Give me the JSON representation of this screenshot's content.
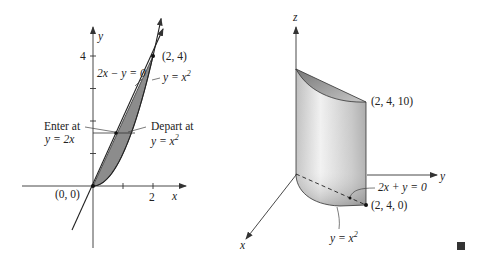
{
  "left_panel": {
    "axis_x_label": "x",
    "axis_y_label": "y",
    "tick_x_label": "2",
    "tick_y_label": "4",
    "origin_label": "(0, 0)",
    "point_label": "(2, 4)",
    "line_label": "2x − y = 0",
    "curve_label": "y = x",
    "curve_exp": "2",
    "enter_label_1": "Enter at",
    "enter_label_2": "y = 2x",
    "depart_label_1": "Depart at",
    "depart_label_2": "y = x",
    "depart_exp": "2",
    "region": {
      "bounded_by": [
        "y = 2x",
        "y = x^2"
      ],
      "x_range": [
        0,
        2
      ]
    }
  },
  "right_panel": {
    "axis_x_label": "x",
    "axis_y_label": "y",
    "axis_z_label": "z",
    "top_point_label": "(2, 4, 10)",
    "base_point_label": "(2, 4, 0)",
    "plane_label": "2x + y = 0",
    "curve_label": "y = x",
    "curve_exp": "2"
  },
  "end_mark": "■",
  "colors": {
    "region_fill": "#8c8c8c",
    "solid_light": "#e8e8e8",
    "solid_dark": "#9a9a9a",
    "ink": "#222222"
  }
}
